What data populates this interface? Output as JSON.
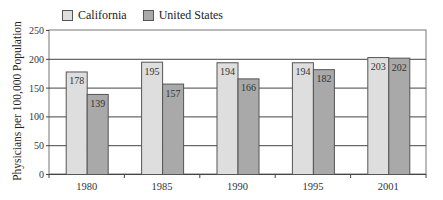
{
  "chart_data": {
    "type": "bar",
    "title": "",
    "xlabel": "",
    "ylabel": "Physicians per 100,000 Population",
    "categories": [
      "1980",
      "1985",
      "1990",
      "1995",
      "2001"
    ],
    "series": [
      {
        "name": "California",
        "color": "#dedede",
        "values": [
          178,
          195,
          194,
          194,
          203
        ]
      },
      {
        "name": "United States",
        "color": "#a9a9a9",
        "values": [
          139,
          157,
          166,
          182,
          202
        ]
      }
    ],
    "ylim": [
      0,
      250
    ],
    "yticks": [
      0,
      50,
      100,
      150,
      200,
      250
    ],
    "grid": true,
    "legend_position": "top-left"
  },
  "legend": {
    "items": [
      {
        "label": "California",
        "color": "#dedede"
      },
      {
        "label": "United States",
        "color": "#a9a9a9"
      }
    ]
  }
}
